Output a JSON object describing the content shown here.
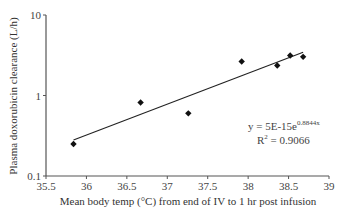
{
  "chart_data": {
    "type": "scatter",
    "title": "",
    "xlabel": "Mean body temp (°C) from end of IV to 1 hr post infusion",
    "ylabel": "Plasma doxorubicin clearance (L/h)",
    "xlim": [
      35.5,
      39
    ],
    "ylim": [
      0.1,
      10
    ],
    "yscale": "log",
    "x_ticks": [
      "35.5",
      "36",
      "36.5",
      "37",
      "37.5",
      "38",
      "38.5",
      "39"
    ],
    "y_ticks": [
      "0.1",
      "1",
      "10"
    ],
    "grid": false,
    "legend": null,
    "series": [
      {
        "name": "Observations",
        "marker": "diamond",
        "points": [
          {
            "x": 35.84,
            "y": 0.25
          },
          {
            "x": 36.67,
            "y": 0.82
          },
          {
            "x": 37.26,
            "y": 0.6
          },
          {
            "x": 37.92,
            "y": 2.64
          },
          {
            "x": 38.36,
            "y": 2.36
          },
          {
            "x": 38.52,
            "y": 3.14
          },
          {
            "x": 38.68,
            "y": 3.02
          }
        ]
      }
    ],
    "trendline": {
      "type": "exponential",
      "equation": "y = 5E-15e^0.8844x",
      "r_squared": "0.9066",
      "x_start": 35.84,
      "x_end": 38.68
    },
    "annotations": {
      "equation_base": "y = 5E-15e",
      "equation_exp": "0.8844x",
      "r2_prefix": "R",
      "r2_sup": "2",
      "r2_value": " = 0.9066"
    }
  },
  "colors": {
    "axis": "#555555",
    "marker": "#111111",
    "trendline": "#222222",
    "text": "#444444"
  }
}
